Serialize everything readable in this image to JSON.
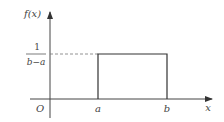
{
  "diagram": {
    "type": "uniform-distribution-pdf",
    "y_axis_label": "f(x)",
    "x_axis_label": "x",
    "origin_label": "O",
    "x_ticks": [
      "a",
      "b"
    ],
    "height_label": {
      "numerator": "1",
      "denominator": "b−a"
    },
    "colors": {
      "stroke": "#333333",
      "dashed": "#777777",
      "text": "#444444"
    }
  }
}
